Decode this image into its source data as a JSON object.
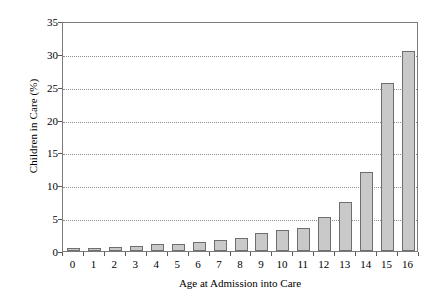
{
  "chart_data": {
    "type": "bar",
    "title": "",
    "xlabel": "Age at Admission into Care",
    "ylabel": "Children in Care (%)",
    "categories": [
      "0",
      "1",
      "2",
      "3",
      "4",
      "5",
      "6",
      "7",
      "8",
      "9",
      "10",
      "11",
      "12",
      "13",
      "14",
      "15",
      "16"
    ],
    "values": [
      0.5,
      0.5,
      0.6,
      0.8,
      1.1,
      1.1,
      1.4,
      1.7,
      2.0,
      2.7,
      3.2,
      3.5,
      5.2,
      7.5,
      12.0,
      25.5,
      30.5
    ],
    "ylim": [
      0,
      35
    ],
    "yticks": [
      0,
      5,
      10,
      15,
      20,
      25,
      30,
      35
    ],
    "ytick_labels": [
      "0",
      "5",
      "10",
      "15",
      "20",
      "25",
      "30",
      "35"
    ],
    "grid": true,
    "legend": "none",
    "bar_fill_color": "#c9c9c9",
    "bar_border_color": "#6e6e6e",
    "axis_color": "#7b7b7b",
    "grid_color": "#8c8c8c"
  }
}
